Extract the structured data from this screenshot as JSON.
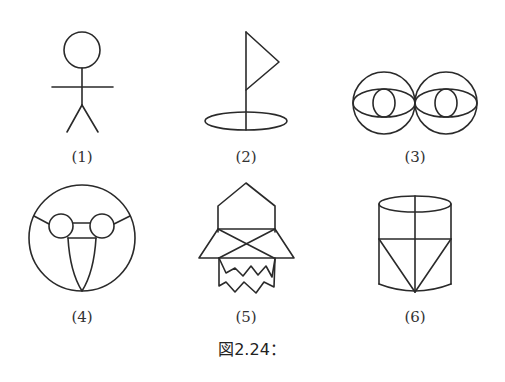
{
  "figure": {
    "caption": "図2.24：",
    "stroke_color": "#2a2a2a",
    "background": "#ffffff",
    "items": [
      {
        "label": "(1)",
        "subject": "stick figure person"
      },
      {
        "label": "(2)",
        "subject": "flag on pole in hole"
      },
      {
        "label": "(3)",
        "subject": "two tangent circles with eyes"
      },
      {
        "label": "(4)",
        "subject": "circle face with goggles and tongue"
      },
      {
        "label": "(5)",
        "subject": "house-like shape with crossed triangles and zigzags"
      },
      {
        "label": "(6)",
        "subject": "cylinder with inscribed triangle"
      }
    ]
  }
}
